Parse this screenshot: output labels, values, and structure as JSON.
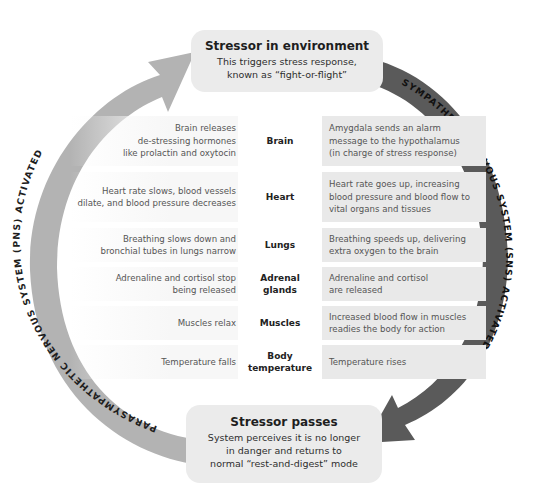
{
  "top_box": {
    "title": "Stressor in environment",
    "body": "This triggers stress response,\nknown as “fight-or-flight”"
  },
  "bottom_box": {
    "title": "Stressor passes",
    "body": "System perceives it is no longer\nin danger and returns to\nnormal “rest-and-digest” mode"
  },
  "arcs": {
    "pns_label": "PARASYMPATHETIC NERVOUS SYSTEM (PNS) ACTIVATED",
    "sns_label": "SYMPATHETIC NERVOUS SYSTEM (SNS) ACTIVATED",
    "pns_color": "#b3b3b3",
    "sns_color": "#5a5a5a"
  },
  "rows": [
    {
      "organ": "Brain",
      "pns": "Brain releases\nde-stressing hormones\nlike prolactin and oxytocin",
      "sns": "Amygdala sends an alarm\nmessage to the hypothalamus\n(in charge of stress response)"
    },
    {
      "organ": "Heart",
      "pns": "Heart rate slows, blood vessels\ndilate, and blood pressure decreases",
      "sns": "Heart rate goes up, increasing\nblood pressure and blood flow to\nvital organs and tissues"
    },
    {
      "organ": "Lungs",
      "pns": "Breathing slows down and\nbronchial tubes in lungs narrow",
      "sns": "Breathing speeds up, delivering\nextra oxygen to the brain"
    },
    {
      "organ": "Adrenal\nglands",
      "pns": "Adrenaline and cortisol stop\nbeing released",
      "sns": "Adrenaline and cortisol\nare released"
    },
    {
      "organ": "Muscles",
      "pns": "Muscles relax",
      "sns": "Increased blood flow in muscles\nreadies the body for action"
    },
    {
      "organ": "Body\ntemperature",
      "pns": "Temperature falls",
      "sns": "Temperature rises"
    }
  ]
}
